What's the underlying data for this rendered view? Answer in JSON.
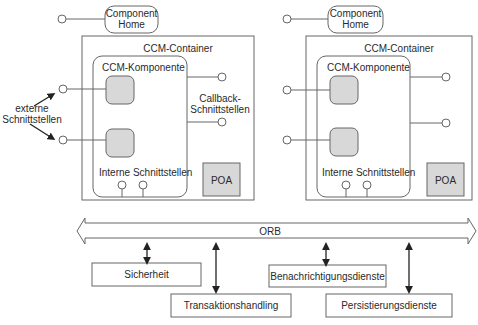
{
  "diagram": {
    "left": {
      "component_home": [
        "Component",
        "Home"
      ],
      "container_label": "CCM-Container",
      "component_label": "CCM-Komponente",
      "callback_label": [
        "Callback-",
        "Schnittstellen"
      ],
      "internal_label": "Interne Schnittstellen",
      "poa_label": "POA"
    },
    "right": {
      "component_home": [
        "Component",
        "Home"
      ],
      "container_label": "CCM-Container",
      "component_label": "CCM-Komponente",
      "internal_label": "Interne Schnittstellen",
      "poa_label": "POA"
    },
    "external_label": [
      "externe",
      "Schnittstellen"
    ],
    "orb_label": "ORB",
    "services": [
      {
        "label": "Sicherheit"
      },
      {
        "label": "Transaktionshandling"
      },
      {
        "label": "Benachrichtigungsdienste"
      },
      {
        "label": "Persistierungsdienste"
      }
    ],
    "colors": {
      "line": "#555555",
      "box_fill": "#d8d8d8",
      "arrow": "#222222"
    }
  }
}
